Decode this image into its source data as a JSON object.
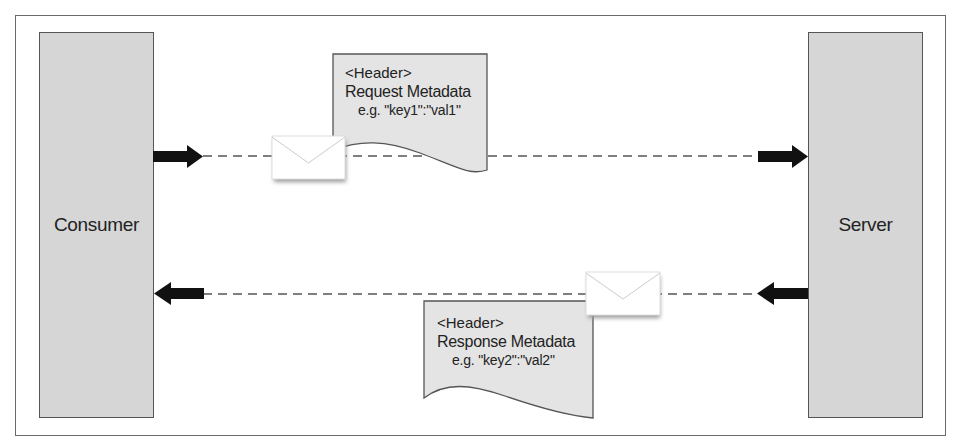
{
  "diagram": {
    "type": "sequence / request-response metadata flow",
    "actors": [
      {
        "id": "consumer",
        "label": "Consumer"
      },
      {
        "id": "server",
        "label": "Server"
      }
    ],
    "messages": [
      {
        "direction": "consumer-to-server",
        "note": {
          "tag": "<Header>",
          "title": "Request Metadata",
          "example": "e.g. \"key1\":\"val1\""
        }
      },
      {
        "direction": "server-to-consumer",
        "note": {
          "tag": "<Header>",
          "title": "Response Metadata",
          "example": "e.g. \"key2\":\"val2\""
        }
      }
    ],
    "icons": [
      "envelope-icon",
      "arrow-right-icon",
      "arrow-left-icon"
    ],
    "colors": {
      "actor_fill": "#d6d6d6",
      "note_fill": "#e4e4e4",
      "stroke": "#555555",
      "arrow": "#111111"
    }
  }
}
